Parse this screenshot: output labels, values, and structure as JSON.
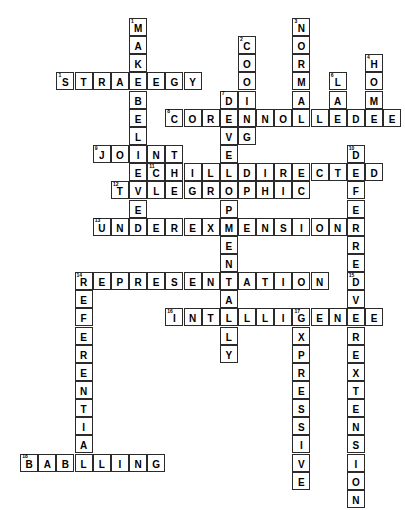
{
  "puzzle": {
    "title": "Crossword Puzzle",
    "cell_size_px": 18,
    "grid_origin": {
      "x": 2,
      "y": 18
    },
    "border_color": "#2b2b2b",
    "cell_background": "#ffffff",
    "letter_color": "#000000",
    "entries": [
      {
        "number": "1",
        "answer": "MAKEBELIEVE",
        "direction": "down",
        "row": 0,
        "col": 7
      },
      {
        "number": "1",
        "answer": "STRATEGY",
        "direction": "across",
        "row": 3,
        "col": 3
      },
      {
        "number": "2",
        "answer": "COOING",
        "direction": "down",
        "row": 1,
        "col": 13
      },
      {
        "number": "3",
        "answer": "NORMAL",
        "direction": "down",
        "row": 0,
        "col": 16
      },
      {
        "number": "4",
        "answer": "HOME",
        "direction": "down",
        "row": 2,
        "col": 20
      },
      {
        "number": "6",
        "answer": "LA",
        "direction": "down",
        "row": 3,
        "col": 18
      },
      {
        "number": "7",
        "answer": "DEVELOPMENTALLY",
        "direction": "down",
        "row": 4,
        "col": 12
      },
      {
        "number": "8",
        "answer": "COREKNOWLEDGE",
        "direction": "across",
        "row": 5,
        "col": 9
      },
      {
        "number": "9",
        "answer": "JOINT",
        "direction": "across",
        "row": 7,
        "col": 5
      },
      {
        "number": "10",
        "answer": "DEFERRED",
        "direction": "down",
        "row": 7,
        "col": 19
      },
      {
        "number": "11",
        "answer": "CHILDDIRECTED",
        "direction": "across",
        "row": 8,
        "col": 8
      },
      {
        "number": "12",
        "answer": "TELEGRAPHIC",
        "direction": "across",
        "row": 9,
        "col": 6
      },
      {
        "number": "13",
        "answer": "UNDEREXTENSION",
        "direction": "across",
        "row": 11,
        "col": 5
      },
      {
        "number": "14",
        "answer": "REPRESENTATION",
        "direction": "across",
        "row": 14,
        "col": 4
      },
      {
        "number": "14",
        "answer": "REFERENTIAL",
        "direction": "down",
        "row": 14,
        "col": 4
      },
      {
        "number": "15",
        "answer": "OVEREXTENSION",
        "direction": "down",
        "row": 14,
        "col": 19
      },
      {
        "number": "16",
        "answer": "INTELLIGENCE",
        "direction": "across",
        "row": 16,
        "col": 9
      },
      {
        "number": "17",
        "answer": "EXPRESSIVE",
        "direction": "down",
        "row": 16,
        "col": 16
      },
      {
        "number": "18",
        "answer": "BABBLING",
        "direction": "across",
        "row": 24,
        "col": 1
      }
    ]
  }
}
